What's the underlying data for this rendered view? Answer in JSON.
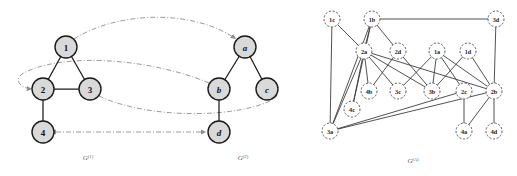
{
  "figure": {
    "width": 517,
    "height": 176,
    "background": "#ffffff",
    "node_fill_shaded": "#d9d9d9",
    "node_fill_open": "#ffffff",
    "edge_color": "#1a1a1a",
    "mapping_color": "#8f8f8f"
  },
  "graphs": [
    {
      "id": "G1",
      "caption_base": "G",
      "caption_sup": "(1)",
      "caption_x": 88,
      "caption_y": 160,
      "node_style": "shaded",
      "nodes": [
        {
          "id": "1",
          "label": "1",
          "x": 66,
          "y": 47,
          "r": 11,
          "italic": false
        },
        {
          "id": "2",
          "label": "2",
          "x": 43,
          "y": 89,
          "r": 11,
          "italic": false
        },
        {
          "id": "3",
          "label": "3",
          "x": 90,
          "y": 89,
          "r": 11,
          "italic": false
        },
        {
          "id": "4",
          "label": "4",
          "x": 43,
          "y": 132,
          "r": 11,
          "italic": false
        }
      ],
      "edges": [
        {
          "from": "1",
          "to": "2"
        },
        {
          "from": "1",
          "to": "3"
        },
        {
          "from": "2",
          "to": "3"
        },
        {
          "from": "2",
          "to": "4"
        }
      ]
    },
    {
      "id": "G2",
      "caption_base": "G",
      "caption_sup": "(2)",
      "caption_x": 243,
      "caption_y": 160,
      "node_style": "shaded",
      "nodes": [
        {
          "id": "a",
          "label": "a",
          "x": 245,
          "y": 47,
          "r": 11,
          "italic": true
        },
        {
          "id": "b",
          "label": "b",
          "x": 219,
          "y": 89,
          "r": 11,
          "italic": true
        },
        {
          "id": "c",
          "label": "c",
          "x": 267,
          "y": 89,
          "r": 11,
          "italic": true
        },
        {
          "id": "d",
          "label": "d",
          "x": 219,
          "y": 132,
          "r": 11,
          "italic": true
        }
      ],
      "edges": [
        {
          "from": "a",
          "to": "b"
        },
        {
          "from": "a",
          "to": "c"
        },
        {
          "from": "b",
          "to": "d"
        }
      ]
    },
    {
      "id": "GA",
      "caption_base": "G",
      "caption_sup": "(A)",
      "caption_x": 413,
      "caption_y": 163,
      "node_style": "open-dashed",
      "nodes": [
        {
          "id": "1c",
          "label": "1c",
          "x": 332,
          "y": 19,
          "r": 8
        },
        {
          "id": "1b",
          "label": "1b",
          "x": 372,
          "y": 19,
          "r": 8
        },
        {
          "id": "3d",
          "label": "3d",
          "x": 496,
          "y": 19,
          "r": 8
        },
        {
          "id": "2a",
          "label": "2a",
          "x": 364,
          "y": 51,
          "r": 8
        },
        {
          "id": "2d",
          "label": "2d",
          "x": 398,
          "y": 51,
          "r": 8
        },
        {
          "id": "1a",
          "label": "1a",
          "x": 437,
          "y": 51,
          "r": 8
        },
        {
          "id": "1d",
          "label": "1d",
          "x": 468,
          "y": 51,
          "r": 8
        },
        {
          "id": "4b",
          "label": "4b",
          "x": 369,
          "y": 91,
          "r": 8
        },
        {
          "id": "3c",
          "label": "3c",
          "x": 398,
          "y": 91,
          "r": 8
        },
        {
          "id": "3b",
          "label": "3b",
          "x": 432,
          "y": 91,
          "r": 8
        },
        {
          "id": "2c",
          "label": "2c",
          "x": 464,
          "y": 91,
          "r": 8
        },
        {
          "id": "2b",
          "label": "2b",
          "x": 494,
          "y": 91,
          "r": 8
        },
        {
          "id": "4c",
          "label": "4c",
          "x": 352,
          "y": 109,
          "r": 8
        },
        {
          "id": "3a",
          "label": "3a",
          "x": 330,
          "y": 131,
          "r": 8
        },
        {
          "id": "4a",
          "label": "4a",
          "x": 464,
          "y": 131,
          "r": 8
        },
        {
          "id": "4d",
          "label": "4d",
          "x": 494,
          "y": 131,
          "r": 8
        }
      ],
      "edges": [
        {
          "from": "1c",
          "to": "2a"
        },
        {
          "from": "1c",
          "to": "3a"
        },
        {
          "from": "1b",
          "to": "3d"
        },
        {
          "from": "1b",
          "to": "2a"
        },
        {
          "from": "1b",
          "to": "2d"
        },
        {
          "from": "1b",
          "to": "4c"
        },
        {
          "from": "1b",
          "to": "3a"
        },
        {
          "from": "3d",
          "to": "2b"
        },
        {
          "from": "2a",
          "to": "4b"
        },
        {
          "from": "2a",
          "to": "3c"
        },
        {
          "from": "2a",
          "to": "3b"
        },
        {
          "from": "2a",
          "to": "2b"
        },
        {
          "from": "2a",
          "to": "3a"
        },
        {
          "from": "2a",
          "to": "4c"
        },
        {
          "from": "2d",
          "to": "3b"
        },
        {
          "from": "2d",
          "to": "4b"
        },
        {
          "from": "1a",
          "to": "3b"
        },
        {
          "from": "1a",
          "to": "3c"
        },
        {
          "from": "1a",
          "to": "2c"
        },
        {
          "from": "1a",
          "to": "2b"
        },
        {
          "from": "1d",
          "to": "3b"
        },
        {
          "from": "1d",
          "to": "2b"
        },
        {
          "from": "2c",
          "to": "4a"
        },
        {
          "from": "2b",
          "to": "4a"
        },
        {
          "from": "2b",
          "to": "4d"
        },
        {
          "from": "2b",
          "to": "3a"
        },
        {
          "from": "2c",
          "to": "3a"
        }
      ]
    }
  ],
  "mappings": {
    "description": "dash-dot mapping arrows between G(1) and G(2)",
    "arrows": [
      {
        "id": "1-to-a",
        "from": "1",
        "to": "a",
        "direction": "forward",
        "kind": "arc-top"
      },
      {
        "id": "b-to-2",
        "from": "b",
        "to": "2",
        "direction": "forward",
        "kind": "arc-mid-upper"
      },
      {
        "id": "3-to-c",
        "from": "3",
        "to": "c",
        "direction": "forward",
        "kind": "arc-mid-lower"
      },
      {
        "id": "4-d",
        "from": "4",
        "to": "d",
        "direction": "both",
        "kind": "straight"
      }
    ]
  }
}
